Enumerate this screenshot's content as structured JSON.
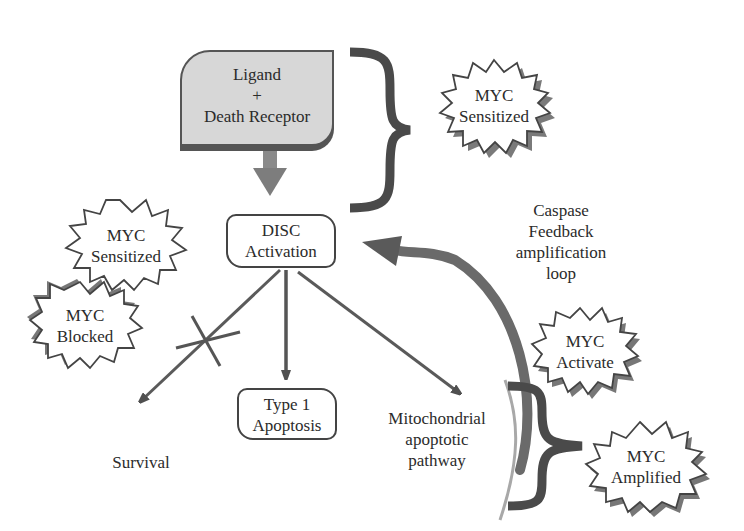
{
  "diagram": {
    "nodes": {
      "ligand": {
        "lines": [
          "Ligand",
          "+",
          "Death Receptor"
        ]
      },
      "disc": {
        "lines": [
          "DISC",
          "Activation"
        ]
      },
      "type1": {
        "lines": [
          "Type 1",
          "Apoptosis"
        ]
      },
      "mito": {
        "lines": [
          "Mitochondrial",
          "apoptotic",
          "pathway"
        ]
      },
      "survival": {
        "lines": [
          "Survival"
        ]
      },
      "caspase": {
        "lines": [
          "Caspase",
          "Feedback",
          "amplification",
          "loop"
        ]
      }
    },
    "badges": {
      "myc_top": {
        "lines": [
          "MYC",
          "Sensitized"
        ]
      },
      "myc_left": {
        "lines": [
          "MYC",
          "Sensitized"
        ]
      },
      "myc_blocked": {
        "lines": [
          "MYC",
          "Blocked"
        ]
      },
      "myc_activate": {
        "lines": [
          "MYC",
          "Activate"
        ]
      },
      "myc_amplified": {
        "lines": [
          "MYC",
          "Amplified"
        ]
      }
    },
    "edges": [
      {
        "from": "ligand",
        "to": "disc",
        "style": "thick-gray-arrow"
      },
      {
        "from": "disc",
        "to": "survival",
        "style": "arrow",
        "blocked": true
      },
      {
        "from": "disc",
        "to": "type1",
        "style": "arrow"
      },
      {
        "from": "disc",
        "to": "mito",
        "style": "arrow"
      },
      {
        "from": "mito",
        "to": "disc",
        "style": "curved-feedback-arrow",
        "label": "caspase"
      }
    ],
    "colors": {
      "fill_gray": "#d7d7d7",
      "stroke": "#444444",
      "arrow": "#555555",
      "shadow": "#777777"
    }
  }
}
